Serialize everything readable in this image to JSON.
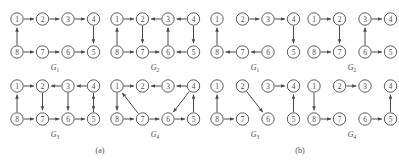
{
  "figure": {
    "type": "diagram",
    "node_labels": [
      "1",
      "2",
      "3",
      "4",
      "5",
      "6",
      "7",
      "8"
    ],
    "colors": {
      "node_stroke": "#4a4a4a",
      "node_fill": "#ffffff",
      "edge": "#4a4a4a",
      "label": "#4a4a4a",
      "background": "#ffffff"
    }
  },
  "panels": [
    {
      "id": "a",
      "caption": "(a)"
    },
    {
      "id": "b",
      "caption": "(b)"
    }
  ],
  "graphs": [
    {
      "id": "a1",
      "panel": "a",
      "label": "G",
      "subscript": "1",
      "edges": [
        {
          "from": "1",
          "to": "2"
        },
        {
          "from": "2",
          "to": "3"
        },
        {
          "from": "3",
          "to": "4"
        },
        {
          "from": "4",
          "to": "5"
        },
        {
          "from": "8",
          "to": "7"
        },
        {
          "from": "7",
          "to": "6"
        },
        {
          "from": "6",
          "to": "5"
        },
        {
          "from": "8",
          "to": "1"
        }
      ]
    },
    {
      "id": "a2",
      "panel": "a",
      "label": "G",
      "subscript": "2",
      "edges": [
        {
          "from": "1",
          "to": "2"
        },
        {
          "from": "3",
          "to": "2"
        },
        {
          "from": "4",
          "to": "3"
        },
        {
          "from": "8",
          "to": "7"
        },
        {
          "from": "7",
          "to": "6"
        },
        {
          "from": "5",
          "to": "6"
        },
        {
          "from": "8",
          "to": "1"
        },
        {
          "from": "2",
          "to": "7"
        },
        {
          "from": "6",
          "to": "3"
        },
        {
          "from": "4",
          "to": "5"
        }
      ]
    },
    {
      "id": "a3",
      "panel": "a",
      "label": "G",
      "subscript": "3",
      "edges": [
        {
          "from": "1",
          "to": "2"
        },
        {
          "from": "3",
          "to": "2"
        },
        {
          "from": "4",
          "to": "3"
        },
        {
          "from": "8",
          "to": "7"
        },
        {
          "from": "7",
          "to": "6"
        },
        {
          "from": "6",
          "to": "5"
        },
        {
          "from": "8",
          "to": "1"
        },
        {
          "from": "2",
          "to": "7"
        },
        {
          "from": "3",
          "to": "6"
        },
        {
          "from": "4",
          "to": "5"
        },
        {
          "from": "5",
          "to": "4"
        }
      ]
    },
    {
      "id": "a4",
      "panel": "a",
      "label": "G",
      "subscript": "4",
      "edges": [
        {
          "from": "1",
          "to": "2"
        },
        {
          "from": "3",
          "to": "2"
        },
        {
          "from": "4",
          "to": "3"
        },
        {
          "from": "8",
          "to": "7"
        },
        {
          "from": "7",
          "to": "6"
        },
        {
          "from": "6",
          "to": "5"
        },
        {
          "from": "1",
          "to": "8"
        },
        {
          "from": "7",
          "to": "1"
        },
        {
          "from": "4",
          "to": "6"
        },
        {
          "from": "5",
          "to": "4"
        }
      ]
    },
    {
      "id": "b1",
      "panel": "b",
      "label": "G",
      "subscript": "1",
      "edges": [
        {
          "from": "2",
          "to": "3"
        },
        {
          "from": "3",
          "to": "4"
        },
        {
          "from": "4",
          "to": "5"
        },
        {
          "from": "7",
          "to": "8"
        },
        {
          "from": "6",
          "to": "7"
        },
        {
          "from": "8",
          "to": "1"
        }
      ]
    },
    {
      "id": "b2",
      "panel": "b",
      "label": "G",
      "subscript": "2",
      "edges": [
        {
          "from": "1",
          "to": "2"
        },
        {
          "from": "3",
          "to": "4"
        },
        {
          "from": "8",
          "to": "7"
        },
        {
          "from": "6",
          "to": "5"
        },
        {
          "from": "2",
          "to": "7"
        },
        {
          "from": "6",
          "to": "3"
        }
      ]
    },
    {
      "id": "b3",
      "panel": "b",
      "label": "G",
      "subscript": "3",
      "edges": [
        {
          "from": "3",
          "to": "4"
        },
        {
          "from": "8",
          "to": "7"
        },
        {
          "from": "8",
          "to": "1"
        },
        {
          "from": "2",
          "to": "6"
        },
        {
          "from": "5",
          "to": "4"
        }
      ]
    },
    {
      "id": "b4",
      "panel": "b",
      "label": "G",
      "subscript": "4",
      "edges": [
        {
          "from": "2",
          "to": "3"
        },
        {
          "from": "8",
          "to": "7"
        },
        {
          "from": "6",
          "to": "5"
        },
        {
          "from": "1",
          "to": "8"
        },
        {
          "from": "5",
          "to": "4"
        }
      ]
    }
  ]
}
